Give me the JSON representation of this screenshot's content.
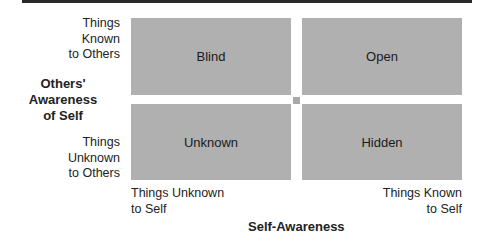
{
  "diagram": {
    "quadrants": {
      "top_left": "Blind",
      "top_right": "Open",
      "bottom_left": "Unknown",
      "bottom_right": "Hidden"
    },
    "y_axis": {
      "title": "Others'\nAwareness\nof Self",
      "top_label": "Things\nKnown\nto Others",
      "bottom_label": "Things\nUnknown\nto Others"
    },
    "x_axis": {
      "title": "Self-Awareness",
      "left_label": "Things Unknown\nto Self",
      "right_label": "Things Known\nto Self"
    },
    "colors": {
      "quadrant_fill": "#b0b0b0",
      "top_bar": "#2a2a2a",
      "background": "#ffffff"
    }
  }
}
